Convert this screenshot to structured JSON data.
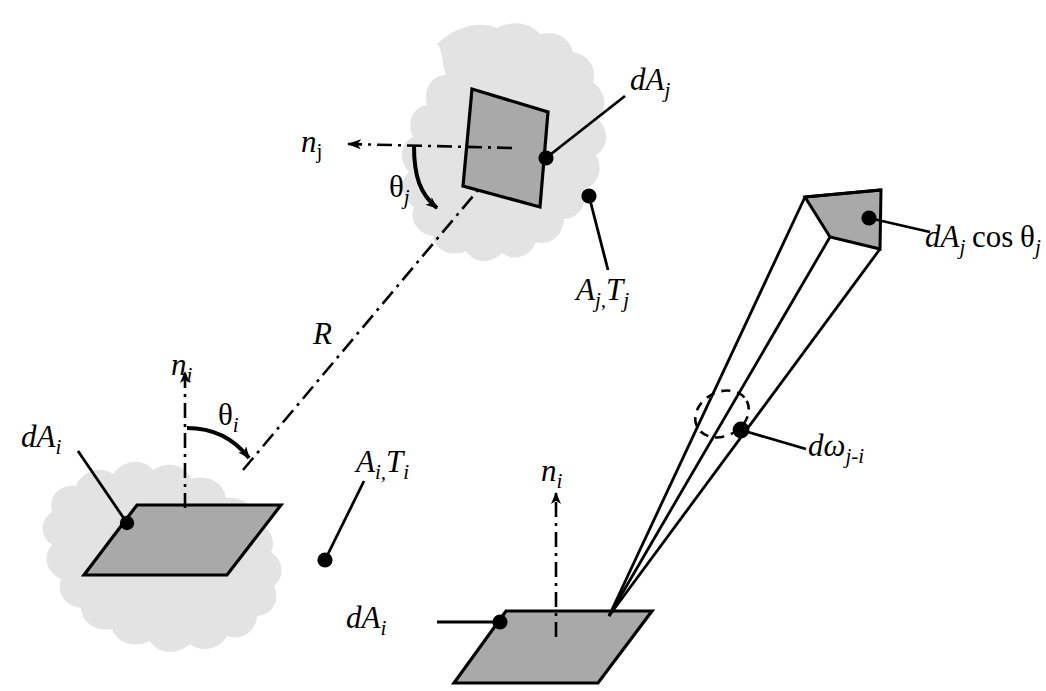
{
  "figure": {
    "type": "technical-diagram",
    "background_color": "#ffffff",
    "line_color": "#000000",
    "patch_fill": "#a9a9a9",
    "blob_fill": "#e3e3e3",
    "width": 1046,
    "height": 691
  },
  "labels": {
    "n_j": {
      "base": "n",
      "sub": "j"
    },
    "theta_j": {
      "base": "θ",
      "sub": "j"
    },
    "dA_j": {
      "base": "dA",
      "sub": "j"
    },
    "A_j_T_j": {
      "a": "A",
      "a_sub": "j,",
      "t": "T",
      "t_sub": "j"
    },
    "R": {
      "base": "R"
    },
    "n_i_left": {
      "base": "n",
      "sub": "i"
    },
    "theta_i": {
      "base": "θ",
      "sub": "i"
    },
    "dA_i_left": {
      "base": "dA",
      "sub": "i"
    },
    "A_i_T_i": {
      "a": "A",
      "a_sub": "i,",
      "t": "T",
      "t_sub": "i"
    },
    "dA_j_cos_theta_j": {
      "base": "dA",
      "sub": "j",
      "fn": "cos",
      "theta": "θ",
      "theta_sub": "j"
    },
    "domega_j_i": {
      "base": "dω",
      "sub": "j-i"
    },
    "n_i_bottom": {
      "base": "n",
      "sub": "i"
    },
    "dA_i_bottom": {
      "base": "dA",
      "sub": "i"
    }
  },
  "elements": {
    "upper_surface": "patch dA_j on surface A_j at temperature T_j",
    "lower_left_surface": "patch dA_i on surface A_i at temperature T_i",
    "ray": "dash-dot line of length R connecting dA_i to dA_j",
    "solid_angle_cone": "beam from dA_i subtending solid angle dω_j-i ending in projected area dA_j cosθ_j",
    "bottom_surface": "patch dA_i with normal n_i and emitted beam"
  }
}
